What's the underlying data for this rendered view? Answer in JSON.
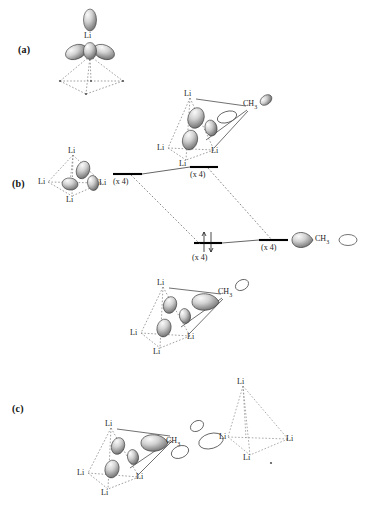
{
  "figure": {
    "background": "#ffffff",
    "ink": "#1a1a1a"
  },
  "panels": [
    {
      "id": "a",
      "label": "(a)",
      "caption": "single lithium sp-hybrid orbitals over tetrahedral face"
    },
    {
      "id": "b",
      "label": "(b)",
      "caption": "orbital interaction diagram between Li4 cluster orbitals and CH3 fragment orbital"
    },
    {
      "id": "c",
      "label": "(c)",
      "caption": "intercluster contact between (CH3Li)4 unit and a neighbouring Li4 cage"
    }
  ],
  "labels": {
    "li": "Li",
    "ch3_c": "CH",
    "ch3_sub": "3",
    "times_four": "(x 4)"
  },
  "panel_a": {
    "atom_label": "Li",
    "orbital_count_top": 1,
    "orbital_count_lobes": 3,
    "frame": "dashed tetrahedral base"
  },
  "panel_b": {
    "fragments": {
      "left": {
        "name": "Li4 cluster orbitals",
        "label": "(x 4)",
        "atom_labels": [
          "Li",
          "Li",
          "Li",
          "Li"
        ]
      },
      "top": {
        "name": "antibonding Li4-CH3 combination",
        "label": "(x 4)",
        "atom_labels": [
          "Li",
          "Li",
          "Li",
          "Li"
        ],
        "ch3": "CH3"
      },
      "bottom": {
        "name": "bonding Li4-CH3 combination",
        "label": "(x 4)",
        "atom_labels": [
          "Li",
          "Li",
          "Li",
          "Li"
        ],
        "ch3": "CH3",
        "electrons": "2"
      },
      "right": {
        "name": "CH3 fragment orbital",
        "label": "(x 4)",
        "ch3": "CH3"
      }
    },
    "levels": [
      {
        "name": "li4-level",
        "label": "(x 4)",
        "electrons": 0
      },
      {
        "name": "antibonding-level",
        "label": "(x 4)",
        "electrons": 0
      },
      {
        "name": "bonding-level",
        "label": "(x 4)",
        "electrons": 2
      },
      {
        "name": "ch3-level",
        "label": "(x 4)",
        "electrons": 0
      }
    ]
  },
  "panel_c": {
    "left_cluster": {
      "atom_labels": [
        "Li",
        "Li",
        "Li",
        "Li"
      ],
      "ch3": "CH3"
    },
    "right_cluster": {
      "atom_labels": [
        "Li",
        "Li",
        "Li",
        "Li"
      ]
    },
    "bridge": {
      "lobes": 2,
      "description": "empty orbital lobes bridging CH3 to neighbouring Li4 cage"
    }
  },
  "colors": {
    "orbital_fill_light": "#e8e8e8",
    "orbital_fill_mid": "#b8b8b8",
    "orbital_fill_dark": "#6e6e6e",
    "outline": "#3a3a3a",
    "dashed": "#777777",
    "level_line": "#000000"
  }
}
